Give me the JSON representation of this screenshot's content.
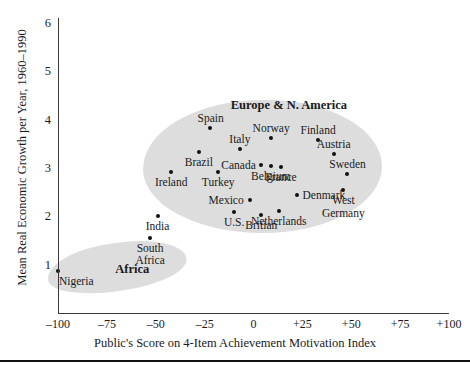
{
  "chart_data": {
    "type": "scatter",
    "title": "",
    "xlabel": "Public's Score on 4-Item Achievement Motivation Index",
    "ylabel": "Mean Real Economic Growth per Year, 1960–1990",
    "xlim": [
      -100,
      100
    ],
    "ylim": [
      0,
      6
    ],
    "xticks": [
      "–100",
      "–75",
      "–50",
      "–25",
      "0",
      "+25",
      "+50",
      "+75",
      "+100"
    ],
    "xtick_values": [
      -100,
      -75,
      -50,
      -25,
      0,
      25,
      50,
      75,
      100
    ],
    "yticks": [
      "6",
      "5",
      "4",
      "3",
      "2",
      "1"
    ],
    "ytick_values": [
      6,
      5,
      4,
      3,
      2,
      1
    ],
    "grid": false,
    "legend": "none",
    "clusters": [
      {
        "name": "Europe & N. America",
        "label_x": 18,
        "label_y": 4.45
      },
      {
        "name": "Africa",
        "label_x": -62,
        "label_y": 1.05
      }
    ],
    "points": [
      {
        "label": "Spain",
        "x": -22,
        "y": 3.82,
        "label_pos": "above"
      },
      {
        "label": "Italy",
        "x": -7,
        "y": 3.4,
        "label_pos": "above"
      },
      {
        "label": "Norway",
        "x": 9,
        "y": 3.62,
        "label_pos": "above"
      },
      {
        "label": "Finland",
        "x": 33,
        "y": 3.58,
        "label_pos": "above"
      },
      {
        "label": "Austria",
        "x": 41,
        "y": 3.3,
        "label_pos": "above"
      },
      {
        "label": "Brazil",
        "x": -28,
        "y": 3.33,
        "label_pos": "below"
      },
      {
        "label": "Canada",
        "x": 4,
        "y": 3.07,
        "label_pos": "left"
      },
      {
        "label": "Belgium",
        "x": 9,
        "y": 3.05,
        "label_pos": "below"
      },
      {
        "label": "Sweden",
        "x": 48,
        "y": 2.87,
        "label_pos": "above"
      },
      {
        "label": "Ireland",
        "x": -42,
        "y": 2.92,
        "label_pos": "below"
      },
      {
        "label": "Turkey",
        "x": -18,
        "y": 2.92,
        "label_pos": "below"
      },
      {
        "label": "France",
        "x": 14,
        "y": 3.02,
        "label_pos": "below"
      },
      {
        "label": "West Germany",
        "x": 46,
        "y": 2.54,
        "label_pos": "below"
      },
      {
        "label": "Mexico",
        "x": -2,
        "y": 2.33,
        "label_pos": "left"
      },
      {
        "label": "Denmark",
        "x": 22,
        "y": 2.44,
        "label_pos": "right"
      },
      {
        "label": "Netherlands",
        "x": 13,
        "y": 2.11,
        "label_pos": "below"
      },
      {
        "label": "U.S.",
        "x": -10,
        "y": 2.08,
        "label_pos": "below"
      },
      {
        "label": "Britian",
        "x": 4,
        "y": 2.03,
        "label_pos": "below"
      },
      {
        "label": "India",
        "x": -49,
        "y": 2.0,
        "label_pos": "below"
      },
      {
        "label": "South Africa",
        "x": -53,
        "y": 1.56,
        "label_pos": "below"
      },
      {
        "label": "Nigeria",
        "x": -100,
        "y": 0.86,
        "label_pos": "below-right"
      }
    ]
  },
  "axes": {
    "y_label": "Mean Real Economic Growth per Year, 1960–1990",
    "x_label": "Public's Score on 4-Item Achievement Motivation Index"
  }
}
